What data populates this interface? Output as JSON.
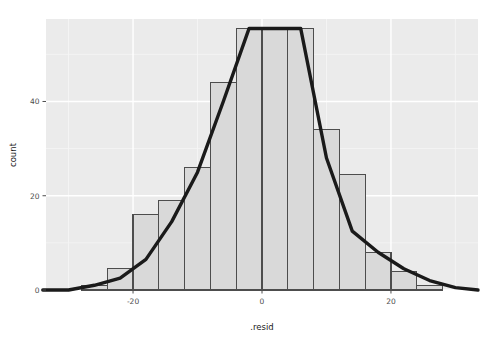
{
  "chart_data": {
    "type": "bar",
    "title": "",
    "subtitle": "",
    "xlabel": ".resid",
    "ylabel": "count",
    "xlim": [
      -33.5,
      33.5
    ],
    "ylim": [
      0,
      57.5
    ],
    "xticks": [
      -20,
      0,
      20
    ],
    "xtick_labels": [
      "-20",
      "0",
      "20"
    ],
    "yticks": [
      0,
      20,
      40
    ],
    "ytick_labels": [
      "0",
      "20",
      "40"
    ],
    "grid": true,
    "legend": "none",
    "binwidth": 4,
    "bin_centers": [
      -30,
      -26,
      -22,
      -18,
      -14,
      -10,
      -6,
      -2,
      2,
      6,
      10,
      14,
      18,
      22,
      26
    ],
    "bin_edges": [
      -32,
      -28,
      -24,
      -20,
      -16,
      -12,
      -8,
      -4,
      0,
      4,
      8,
      12,
      16,
      20,
      24,
      28
    ],
    "categories": [
      "-32..-28",
      "-28..-24",
      "-24..-20",
      "-20..-16",
      "-16..-12",
      "-12..-8",
      "-8..-4",
      "-4..0",
      "0..4",
      "4..8",
      "8..12",
      "12..16",
      "16..20",
      "20..24",
      "24..28"
    ],
    "values": [
      0,
      1,
      4.5,
      16,
      19,
      26,
      44,
      55.5,
      55.5,
      55.5,
      34,
      24.5,
      8,
      4,
      1
    ],
    "series": [
      {
        "name": "histogram",
        "type": "bar",
        "values": [
          0,
          1,
          4.5,
          16,
          19,
          26,
          44,
          55.5,
          55.5,
          55.5,
          34,
          24.5,
          8,
          4,
          1
        ],
        "fill": "#d9d9d9",
        "stroke": "#4d4d4d"
      },
      {
        "name": "frequency-polygon",
        "type": "line",
        "x": [
          -34,
          -30,
          -26,
          -22,
          -18,
          -14,
          -10,
          -6,
          -2,
          2,
          6,
          10,
          14,
          18,
          22,
          26,
          30,
          33.5
        ],
        "values": [
          0,
          0,
          1,
          2.5,
          6.5,
          14.5,
          25,
          40,
          55.5,
          55.5,
          55.5,
          28,
          12.5,
          8,
          4.5,
          2,
          0.5,
          0
        ],
        "stroke": "#1a1a1a"
      }
    ],
    "colors": {
      "panel_background": "#ebebeb",
      "grid_major": "#ffffff",
      "grid_minor": "#f5f5f5",
      "bar_fill": "#d9d9d9",
      "bar_stroke": "#4d4d4d",
      "line_stroke": "#1a1a1a",
      "axis_text": "#4d4d4d",
      "axis_title": "#1a1a1a",
      "plot_background": "#ffffff"
    }
  }
}
